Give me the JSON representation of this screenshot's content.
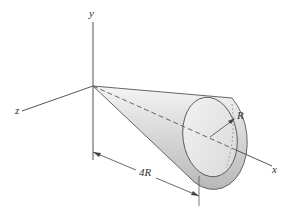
{
  "diagram": {
    "axes": {
      "x_label": "x",
      "y_label": "y",
      "z_label": "z"
    },
    "dimensions": {
      "radius_label": "R",
      "length_label": "4R"
    },
    "colors": {
      "line": "#444444",
      "cone_light": "#f2f2f2",
      "cone_dark": "#bdbdbd",
      "background": "#ffffff"
    }
  }
}
